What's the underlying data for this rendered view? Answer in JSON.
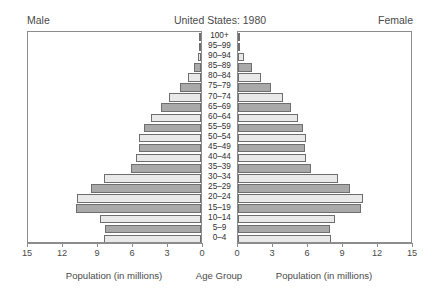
{
  "header": {
    "title": "United States: 1980",
    "male_label": "Male",
    "female_label": "Female"
  },
  "footer": {
    "left_caption": "Population (in millions)",
    "center_caption": "Age Group",
    "right_caption": "Population (in millions)"
  },
  "axis": {
    "male_ticks": [
      "15",
      "12",
      "9",
      "6",
      "3",
      "0"
    ],
    "female_ticks": [
      "0",
      "3",
      "6",
      "9",
      "12",
      "15"
    ]
  },
  "chart_data": {
    "type": "bar",
    "title": "United States: 1980",
    "subtitle": "",
    "orientation": "population-pyramid",
    "xlabel": "Population (in millions)",
    "ylabel": "Age Group",
    "xlim": [
      0,
      15
    ],
    "grid": false,
    "legend_position": "none",
    "categories": [
      "100+",
      "95–99",
      "90–94",
      "85–89",
      "80–84",
      "75–79",
      "70–74",
      "65–69",
      "60–64",
      "55–59",
      "50–54",
      "45–49",
      "40–44",
      "35–39",
      "30–34",
      "25–29",
      "20–24",
      "15–19",
      "10–14",
      "5–9",
      "0–4"
    ],
    "series": [
      {
        "name": "Male",
        "side": "left",
        "values": [
          0.02,
          0.08,
          0.23,
          0.6,
          1.08,
          1.8,
          2.75,
          3.45,
          4.25,
          4.9,
          5.35,
          5.35,
          5.55,
          6.0,
          8.3,
          9.4,
          10.65,
          10.75,
          8.65,
          8.2,
          8.35
        ]
      },
      {
        "name": "Female",
        "side": "right",
        "values": [
          0.04,
          0.18,
          0.52,
          1.18,
          1.95,
          2.85,
          3.85,
          4.55,
          5.1,
          5.6,
          5.85,
          5.75,
          5.85,
          6.25,
          8.55,
          9.6,
          10.75,
          10.55,
          8.35,
          7.85,
          7.95
        ]
      }
    ]
  }
}
